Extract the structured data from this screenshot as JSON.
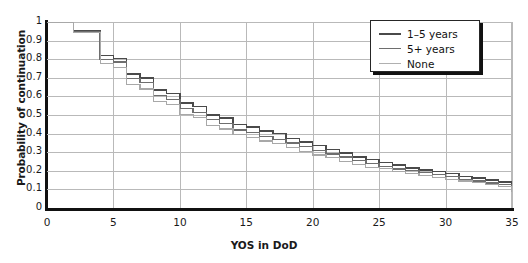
{
  "chart_data": {
    "type": "line",
    "title": "",
    "xlabel": "YOS in DoD",
    "ylabel": "Probability of continuation",
    "xlim": [
      0,
      35
    ],
    "ylim": [
      0,
      1
    ],
    "xticks": [
      "0",
      "5",
      "10",
      "15",
      "20",
      "25",
      "30",
      "35"
    ],
    "yticks": [
      "0",
      "0.1",
      "0.2",
      "0.3",
      "0.4",
      "0.5",
      "0.6",
      "0.7",
      "0.8",
      "0.9",
      "1"
    ],
    "grid": true,
    "step": "post",
    "legend_position": "top-right",
    "series": [
      {
        "name": "1-5 years",
        "color": "#4a4a4a",
        "x": [
          0,
          1,
          2,
          3,
          4,
          5,
          6,
          7,
          8,
          9,
          10,
          11,
          12,
          13,
          14,
          15,
          16,
          17,
          18,
          19,
          20,
          21,
          22,
          23,
          24,
          25,
          26,
          27,
          28,
          29,
          30,
          31,
          32,
          33,
          34,
          35
        ],
        "values": [
          1.0,
          1.0,
          0.955,
          0.955,
          0.82,
          0.805,
          0.72,
          0.7,
          0.635,
          0.615,
          0.565,
          0.545,
          0.5,
          0.485,
          0.45,
          0.435,
          0.415,
          0.4,
          0.375,
          0.355,
          0.335,
          0.315,
          0.295,
          0.275,
          0.26,
          0.245,
          0.23,
          0.215,
          0.205,
          0.195,
          0.185,
          0.17,
          0.16,
          0.15,
          0.14,
          0.13
        ]
      },
      {
        "name": "5+ years",
        "color": "#6e6e6e",
        "x": [
          0,
          1,
          2,
          3,
          4,
          5,
          6,
          7,
          8,
          9,
          10,
          11,
          12,
          13,
          14,
          15,
          16,
          17,
          18,
          19,
          20,
          21,
          22,
          23,
          24,
          25,
          26,
          27,
          28,
          29,
          30,
          31,
          32,
          33,
          34,
          35
        ],
        "values": [
          1.0,
          1.0,
          0.95,
          0.95,
          0.8,
          0.785,
          0.695,
          0.675,
          0.605,
          0.585,
          0.535,
          0.515,
          0.475,
          0.455,
          0.42,
          0.405,
          0.385,
          0.37,
          0.35,
          0.33,
          0.31,
          0.29,
          0.275,
          0.255,
          0.24,
          0.225,
          0.21,
          0.2,
          0.19,
          0.18,
          0.17,
          0.155,
          0.145,
          0.135,
          0.125,
          0.115
        ]
      },
      {
        "name": "None",
        "color": "#a8a8a8",
        "x": [
          0,
          1,
          2,
          3,
          4,
          5,
          6,
          7,
          8,
          9,
          10,
          11,
          12,
          13,
          14,
          15,
          16,
          17,
          18,
          19,
          20,
          21,
          22,
          23,
          24,
          25,
          26,
          27,
          28,
          29,
          30,
          31,
          32,
          33,
          34,
          35
        ],
        "values": [
          1.0,
          1.0,
          0.945,
          0.945,
          0.775,
          0.755,
          0.665,
          0.64,
          0.575,
          0.555,
          0.505,
          0.485,
          0.445,
          0.425,
          0.395,
          0.38,
          0.36,
          0.345,
          0.325,
          0.305,
          0.285,
          0.27,
          0.25,
          0.235,
          0.22,
          0.21,
          0.195,
          0.185,
          0.175,
          0.165,
          0.155,
          0.145,
          0.135,
          0.125,
          0.115,
          0.085
        ]
      }
    ]
  },
  "legend": {
    "items": [
      {
        "label": "1–5 years",
        "color": "#4a4a4a",
        "width": "2.2px"
      },
      {
        "label": "5+ years",
        "color": "#6e6e6e",
        "width": "1.9px"
      },
      {
        "label": "None",
        "color": "#b0b0b0",
        "width": "1.4px"
      }
    ]
  },
  "axes": {
    "x_title": "YOS in DoD",
    "y_title": "Probability of continuation"
  }
}
